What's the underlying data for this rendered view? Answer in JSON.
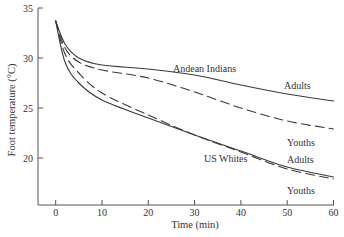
{
  "chart_data": {
    "type": "line",
    "title": "",
    "xlabel": "Time (min)",
    "ylabel": "Foot temperature (°C)",
    "xlim": [
      -4,
      60
    ],
    "ylim": [
      15.3,
      35
    ],
    "xticks": [
      0,
      10,
      20,
      30,
      40,
      50,
      60
    ],
    "yticks": [
      20,
      25,
      30,
      35
    ],
    "grid": false,
    "legend": "none (inline annotations)",
    "x": [
      0,
      2,
      5,
      10,
      20,
      30,
      40,
      50,
      60
    ],
    "series": [
      {
        "name": "Andean Indians - Adults",
        "style": "solid",
        "values": [
          33.7,
          31.4,
          30.0,
          29.3,
          28.9,
          28.3,
          27.3,
          26.4,
          25.7
        ]
      },
      {
        "name": "Andean Indians - Youths",
        "style": "dashed",
        "values": [
          33.7,
          31.0,
          29.6,
          28.8,
          28.0,
          26.6,
          25.0,
          23.7,
          22.9
        ]
      },
      {
        "name": "US Whites - Adults",
        "style": "solid",
        "values": [
          33.7,
          29.6,
          27.5,
          25.8,
          24.0,
          22.3,
          20.7,
          19.1,
          18.1
        ]
      },
      {
        "name": "US Whites - Youths",
        "style": "dashed",
        "values": [
          33.7,
          30.4,
          28.5,
          26.5,
          24.3,
          22.3,
          20.6,
          18.9,
          17.9
        ]
      }
    ],
    "annotations": [
      {
        "text": "Andean Indians",
        "t": 25.5,
        "T": 29.4
      },
      {
        "text": "Adults",
        "t": 48.5,
        "T": 27.0
      },
      {
        "text": "Youths",
        "t": 51.5,
        "T": 21.4
      },
      {
        "text": "US Whites",
        "t": 23.3,
        "T": 20.3
      },
      {
        "text": "Adults",
        "t": 51.5,
        "T": 20.2
      },
      {
        "text": "Youths",
        "t": 51.5,
        "T": 16.7
      }
    ]
  },
  "labels": {
    "xlabel": "Time (min)",
    "ylabel": "Foot temperature (°C)",
    "andean": "Andean Indians",
    "andean_adults": "Adults",
    "andean_youths": "Youths",
    "us": "US Whites",
    "us_adults": "Adults",
    "us_youths": "Youths"
  }
}
